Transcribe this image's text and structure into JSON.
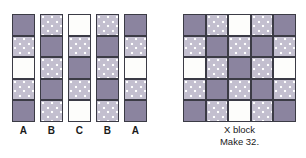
{
  "figure": {
    "background_color": "#ffffff",
    "fabrics": {
      "solid": {
        "name": "solid-purple",
        "color": "#8b849f"
      },
      "dot": {
        "name": "dotted-lavender",
        "color": "#c3bfcf",
        "dot_color": "#ffffff"
      },
      "white": {
        "name": "white-solid",
        "color": "#fdfdfb"
      }
    },
    "grid_line_color": "#3b3b45"
  },
  "strips": {
    "count": 5,
    "rows_per_strip": 5,
    "items": [
      {
        "label": "A",
        "cells": [
          "solid",
          "dot",
          "white",
          "dot",
          "solid"
        ]
      },
      {
        "label": "B",
        "cells": [
          "dot",
          "solid",
          "dot",
          "solid",
          "dot"
        ]
      },
      {
        "label": "C",
        "cells": [
          "white",
          "dot",
          "solid",
          "dot",
          "white"
        ]
      },
      {
        "label": "B",
        "cells": [
          "dot",
          "solid",
          "dot",
          "solid",
          "dot"
        ]
      },
      {
        "label": "A",
        "cells": [
          "solid",
          "dot",
          "white",
          "dot",
          "solid"
        ]
      }
    ]
  },
  "block": {
    "title": "X block",
    "make": "Make 32.",
    "size": "5x5",
    "rows": [
      [
        "solid",
        "dot",
        "white",
        "dot",
        "solid"
      ],
      [
        "dot",
        "solid",
        "dot",
        "solid",
        "dot"
      ],
      [
        "white",
        "dot",
        "solid",
        "dot",
        "white"
      ],
      [
        "dot",
        "solid",
        "dot",
        "solid",
        "dot"
      ],
      [
        "solid",
        "dot",
        "white",
        "dot",
        "solid"
      ]
    ]
  }
}
